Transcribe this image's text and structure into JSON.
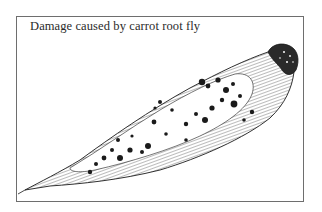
{
  "figure": {
    "caption": "Damage caused by carrot root fly",
    "illustration": {
      "subject": "carrot",
      "icon": "carrot-illustration-icon",
      "features": [
        "crown",
        "hatched-skin",
        "damage-spots",
        "root-tip"
      ]
    },
    "colors": {
      "ink": "#1a1a1a",
      "frame": "#6e6e6e",
      "paper": "#ffffff"
    }
  }
}
